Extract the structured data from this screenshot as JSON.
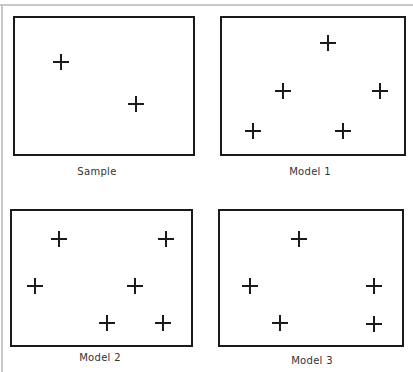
{
  "panels": [
    {
      "id": "sample",
      "label": "Sample",
      "box": {
        "x": 13,
        "y": 16,
        "w": 182,
        "h": 140
      },
      "label_pos": {
        "x": 97,
        "y": 166
      },
      "points": [
        {
          "x": 61,
          "y": 62
        },
        {
          "x": 136,
          "y": 104
        }
      ]
    },
    {
      "id": "model1",
      "label": "Model 1",
      "box": {
        "x": 220,
        "y": 16,
        "w": 186,
        "h": 140
      },
      "label_pos": {
        "x": 310,
        "y": 166
      },
      "points": [
        {
          "x": 328,
          "y": 43
        },
        {
          "x": 283,
          "y": 91
        },
        {
          "x": 380,
          "y": 91
        },
        {
          "x": 253,
          "y": 131
        },
        {
          "x": 343,
          "y": 131
        }
      ]
    },
    {
      "id": "model2",
      "label": "Model 2",
      "box": {
        "x": 10,
        "y": 209,
        "w": 183,
        "h": 138
      },
      "label_pos": {
        "x": 100,
        "y": 352
      },
      "points": [
        {
          "x": 59,
          "y": 239
        },
        {
          "x": 166,
          "y": 239
        },
        {
          "x": 35,
          "y": 286
        },
        {
          "x": 135,
          "y": 286
        },
        {
          "x": 107,
          "y": 323
        },
        {
          "x": 163,
          "y": 323
        }
      ]
    },
    {
      "id": "model3",
      "label": "Model 3",
      "box": {
        "x": 218,
        "y": 209,
        "w": 186,
        "h": 138
      },
      "label_pos": {
        "x": 312,
        "y": 355
      },
      "points": [
        {
          "x": 299,
          "y": 239
        },
        {
          "x": 250,
          "y": 286
        },
        {
          "x": 374,
          "y": 286
        },
        {
          "x": 280,
          "y": 323
        },
        {
          "x": 374,
          "y": 324
        }
      ]
    }
  ],
  "colors": {
    "stroke": "#1a1a1a",
    "frame": "#c8c8c8",
    "text": "#333333"
  }
}
